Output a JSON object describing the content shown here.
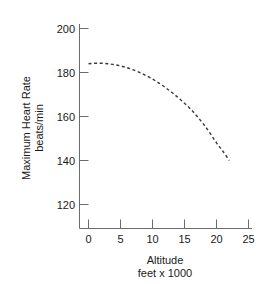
{
  "chart_data": {
    "type": "line",
    "title": "",
    "subtitle": "",
    "xlabel": "Altitude",
    "xlabel_line2": "feet x 1000",
    "ylabel": "Maximum Heart Rate",
    "ylabel_line2": "beats/min",
    "xlim": [
      -1.2,
      25
    ],
    "ylim": [
      120,
      200
    ],
    "xticks": [
      0,
      5,
      10,
      15,
      20,
      25
    ],
    "xtick_labels": [
      "0",
      "5",
      "10",
      "15",
      "20",
      "25"
    ],
    "yticks": [
      120,
      140,
      160,
      180,
      200
    ],
    "ytick_labels": [
      "120",
      "140",
      "160",
      "180",
      "200"
    ],
    "grid": false,
    "legend": false,
    "legend_position": "none",
    "line_style": "dashed",
    "line_color": "#3a3a3a",
    "axis_color": "#6b6b6b",
    "text_color": "#1a1a1a",
    "background_color": "#ffffff",
    "series": [
      {
        "name": "Maximum heart rate vs altitude",
        "x": [
          0,
          1,
          2,
          3,
          4,
          5,
          6,
          7,
          8,
          9,
          10,
          11,
          12,
          13,
          14,
          15,
          16,
          17,
          18,
          19,
          20,
          21,
          22
        ],
        "values": [
          184,
          184.2,
          184.2,
          184,
          183.6,
          183,
          182.2,
          181.2,
          180,
          178.6,
          177,
          175.2,
          173.2,
          171,
          168.6,
          166,
          163.2,
          160,
          156.4,
          152.4,
          148,
          144.2,
          140
        ]
      }
    ]
  },
  "axes": {
    "y_title_line1": "Maximum Heart Rate",
    "y_title_line2": "beats/min",
    "x_title_line1": "Altitude",
    "x_title_line2": "feet x 1000"
  }
}
